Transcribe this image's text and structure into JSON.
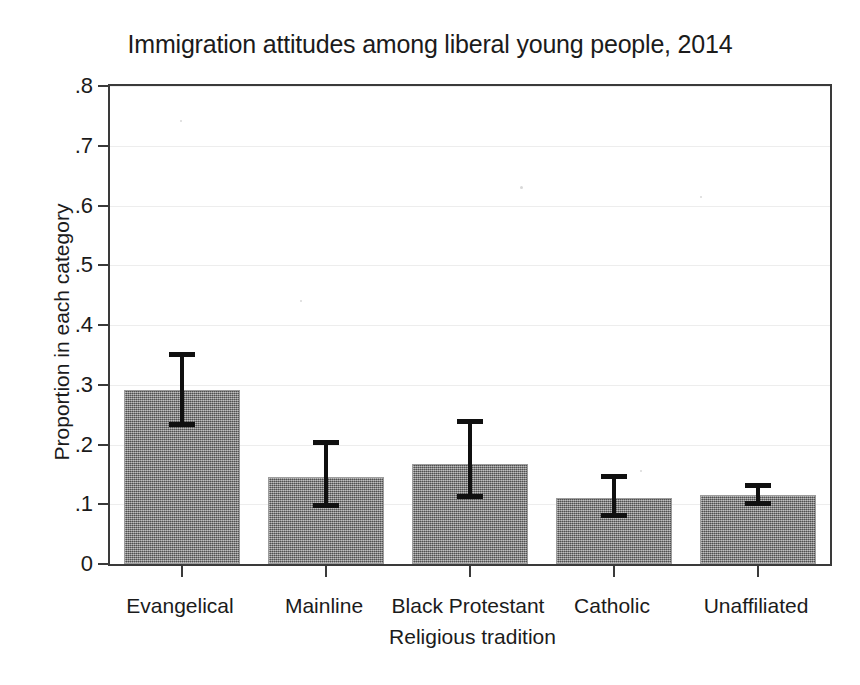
{
  "chart_data": {
    "type": "bar",
    "title": "Immigration attitudes among liberal young people, 2014",
    "xlabel": "Religious tradition",
    "ylabel": "Proportion in each category",
    "categories": [
      "Evangelical",
      "Mainline",
      "Black Protestant",
      "Catholic",
      "Unaffiliated"
    ],
    "values": [
      0.291,
      0.145,
      0.167,
      0.111,
      0.116
    ],
    "errors_low": [
      0.233,
      0.097,
      0.112,
      0.081,
      0.1
    ],
    "errors_high": [
      0.352,
      0.205,
      0.24,
      0.147,
      0.133
    ],
    "ylim": [
      0,
      0.8
    ],
    "ytick_labels": [
      "0",
      ".1",
      ".2",
      ".3",
      ".4",
      ".5",
      ".6",
      ".7",
      ".8"
    ],
    "ytick_values": [
      0,
      0.1,
      0.2,
      0.3,
      0.4,
      0.5,
      0.6,
      0.7,
      0.8
    ],
    "grid": true,
    "legend": "none",
    "bar_color": "#808080",
    "error_color": "#101010",
    "frame_color": "#3a3a3a"
  }
}
